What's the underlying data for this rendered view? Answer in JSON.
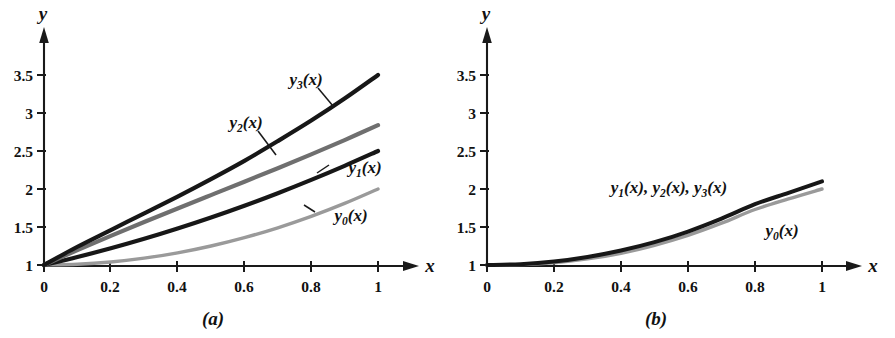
{
  "figure": {
    "background_color": "#ffffff",
    "ink_color": "#1a1a1a",
    "panels": [
      {
        "id": "a",
        "caption": "(a)",
        "x_axis": {
          "label": "x",
          "ticks": [
            "0",
            "0.2",
            "0.4",
            "0.6",
            "0.8",
            "1"
          ],
          "tick_values": [
            0,
            0.2,
            0.4,
            0.6,
            0.8,
            1
          ],
          "range": [
            0,
            1
          ]
        },
        "y_axis": {
          "label": "y",
          "ticks": [
            "1",
            "1.5",
            "2",
            "2.5",
            "3",
            "3.5"
          ],
          "tick_values": [
            1,
            1.5,
            2,
            2.5,
            3,
            3.5
          ],
          "range": [
            1,
            3.5
          ]
        },
        "curve_labels": [
          {
            "name": "y3-label",
            "base": "y",
            "sub": "3",
            "suffix": "(x)"
          },
          {
            "name": "y2-label",
            "base": "y",
            "sub": "2",
            "suffix": "(x)"
          },
          {
            "name": "y1-label",
            "base": "y",
            "sub": "1",
            "suffix": "(x)"
          },
          {
            "name": "y0-label",
            "base": "y",
            "sub": "0",
            "suffix": "(x)"
          }
        ]
      },
      {
        "id": "b",
        "caption": "(b)",
        "x_axis": {
          "label": "x",
          "ticks": [
            "0",
            "0.2",
            "0.4",
            "0.6",
            "0.8",
            "1"
          ],
          "tick_values": [
            0,
            0.2,
            0.4,
            0.6,
            0.8,
            1
          ],
          "range": [
            0,
            1
          ]
        },
        "y_axis": {
          "label": "y",
          "ticks": [
            "1",
            "1.5",
            "2",
            "2.5",
            "3",
            "3.5"
          ],
          "tick_values": [
            1,
            1.5,
            2,
            2.5,
            3,
            3.5
          ],
          "range": [
            1,
            3.5
          ]
        },
        "curve_labels": [
          {
            "name": "y123-label",
            "text": "y1(x), y2(x), y3(x)"
          },
          {
            "name": "y0-label",
            "base": "y",
            "sub": "0",
            "suffix": "(x)"
          }
        ]
      }
    ]
  },
  "chart_data": [
    {
      "type": "line",
      "panel": "a",
      "title": "(a)",
      "xlabel": "x",
      "ylabel": "y",
      "xlim": [
        0,
        1
      ],
      "ylim": [
        1,
        3.5
      ],
      "xticks": [
        0,
        0.2,
        0.4,
        0.6,
        0.8,
        1
      ],
      "xticklabels": [
        "0",
        "0.2",
        "0.4",
        "0.6",
        "0.8",
        "1"
      ],
      "yticks": [
        1,
        1.5,
        2,
        2.5,
        3,
        3.5
      ],
      "yticklabels": [
        "1",
        "1.5",
        "2",
        "2.5",
        "3",
        "3.5"
      ],
      "grid": false,
      "legend": "inline-annotations",
      "x": [
        0,
        0.1,
        0.2,
        0.3,
        0.4,
        0.5,
        0.6,
        0.7,
        0.8,
        0.9,
        1.0
      ],
      "series": [
        {
          "name": "y0(x)",
          "color": "#9a9a9a",
          "annotation": "y0(x)",
          "values": [
            1.0,
            1.01,
            1.04,
            1.09,
            1.16,
            1.25,
            1.36,
            1.49,
            1.64,
            1.81,
            2.0
          ]
        },
        {
          "name": "y1(x)",
          "color": "#171717",
          "annotation": "y1(x)",
          "values": [
            1.0,
            1.105,
            1.22,
            1.345,
            1.48,
            1.625,
            1.78,
            1.945,
            2.12,
            2.305,
            2.5
          ]
        },
        {
          "name": "y2(x)",
          "color": "#6f6f6f",
          "annotation": "y2(x)",
          "values": [
            1.0,
            1.196,
            1.384,
            1.566,
            1.744,
            1.92,
            2.096,
            2.274,
            2.456,
            2.644,
            2.84
          ]
        },
        {
          "name": "y3(x)",
          "color": "#171717",
          "annotation": "y3(x)",
          "values": [
            1.0,
            1.24,
            1.46,
            1.68,
            1.9,
            2.13,
            2.37,
            2.63,
            2.9,
            3.19,
            3.5
          ]
        }
      ]
    },
    {
      "type": "line",
      "panel": "b",
      "title": "(b)",
      "xlabel": "x",
      "ylabel": "y",
      "xlim": [
        0,
        1
      ],
      "ylim": [
        1,
        3.5
      ],
      "xticks": [
        0,
        0.2,
        0.4,
        0.6,
        0.8,
        1
      ],
      "xticklabels": [
        "0",
        "0.2",
        "0.4",
        "0.6",
        "0.8",
        "1"
      ],
      "yticks": [
        1,
        1.5,
        2,
        2.5,
        3,
        3.5
      ],
      "yticklabels": [
        "1",
        "1.5",
        "2",
        "2.5",
        "3",
        "3.5"
      ],
      "grid": false,
      "legend": "inline-annotations",
      "x": [
        0,
        0.1,
        0.2,
        0.3,
        0.4,
        0.5,
        0.6,
        0.7,
        0.8,
        0.9,
        1.0
      ],
      "series": [
        {
          "name": "y1(x), y2(x), y3(x)",
          "color": "#171717",
          "annotation": "y1(x), y2(x), y3(x)",
          "values": [
            1.0,
            1.011,
            1.045,
            1.105,
            1.19,
            1.3,
            1.44,
            1.61,
            1.8,
            1.95,
            2.1
          ]
        },
        {
          "name": "y0(x)",
          "color": "#9a9a9a",
          "annotation": "y0(x)",
          "values": [
            1.0,
            1.005,
            1.03,
            1.08,
            1.155,
            1.26,
            1.39,
            1.55,
            1.73,
            1.87,
            2.0
          ]
        }
      ]
    }
  ]
}
